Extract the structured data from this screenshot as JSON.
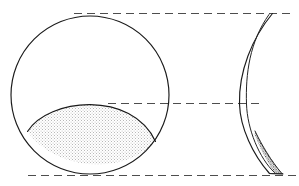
{
  "figure": {
    "background_color": "#ffffff",
    "line_color": "#1a1a1a",
    "reference_line_color": "#4d4d4d",
    "stipple_light_color": "#e8e8e8",
    "stipple_dark_color": "#555555",
    "width": 299,
    "height": 186
  },
  "views": {
    "front": {
      "label": "front-circular-view",
      "circle": {
        "cx": 90,
        "cy": 95,
        "r": 79
      },
      "deposit": {
        "label": "lens-shaped-deposit",
        "left_tip_x": 27,
        "left_tip_y": 131,
        "right_tip_x": 156,
        "right_tip_y": 142,
        "apex_x": 104,
        "apex_y": 103
      }
    },
    "side": {
      "label": "side-profile-view",
      "outer_curve": {
        "top_x": 272,
        "top_y": 13,
        "bottom_x": 282,
        "bottom_y": 174
      },
      "inner_curve": {
        "top_x": 269,
        "top_y": 14,
        "bottom_x": 273,
        "bottom_y": 175
      },
      "deposit": {
        "label": "wedge-shaped-deposit",
        "top_x": 255,
        "top_y": 132,
        "bottom_x": 281,
        "bottom_y": 173
      }
    }
  },
  "reference_lines": [
    {
      "name": "top-reference-line",
      "y": 13,
      "x1": 74,
      "x2": 295
    },
    {
      "name": "middle-reference-line",
      "y": 103,
      "x1": 108,
      "x2": 260
    },
    {
      "name": "bottom-reference-line",
      "y": 175,
      "x1": 28,
      "x2": 296
    }
  ]
}
